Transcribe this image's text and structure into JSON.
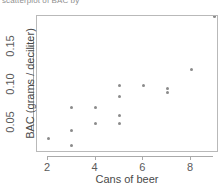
{
  "top_caption": "scatterplot of BAC by",
  "chart_data": {
    "type": "scatter",
    "title": "",
    "xlabel": "Cans of beer",
    "ylabel": "BAC (grams / deciliter)",
    "xlim": [
      0.45,
      9.45
    ],
    "ylim": [
      0.0,
      0.2
    ],
    "grid": false,
    "legend": "none",
    "marker": {
      "shape": "circle",
      "color": "#8b8b8b",
      "size_px": 3
    },
    "frame": true,
    "xticks": [
      2,
      4,
      6,
      8
    ],
    "xtick_labels": [
      "2",
      "4",
      "6",
      "8"
    ],
    "yticks": [
      0.05,
      0.1,
      0.15
    ],
    "ytick_labels": [
      "0.05",
      "0.10",
      "0.15"
    ],
    "x": [
      1,
      2,
      3,
      3,
      3,
      4,
      4,
      5,
      5,
      5,
      5,
      6,
      7,
      7,
      8,
      9
    ],
    "y": [
      0.01,
      0.03,
      0.02,
      0.04,
      0.07,
      0.05,
      0.07,
      0.05,
      0.06,
      0.085,
      0.1,
      0.1,
      0.09,
      0.095,
      0.12,
      0.19
    ],
    "points": [
      {
        "x": 1,
        "y": 0.01
      },
      {
        "x": 2,
        "y": 0.03
      },
      {
        "x": 3,
        "y": 0.02
      },
      {
        "x": 3,
        "y": 0.04
      },
      {
        "x": 3,
        "y": 0.07
      },
      {
        "x": 4,
        "y": 0.05
      },
      {
        "x": 4,
        "y": 0.07
      },
      {
        "x": 5,
        "y": 0.05
      },
      {
        "x": 5,
        "y": 0.06
      },
      {
        "x": 5,
        "y": 0.085
      },
      {
        "x": 5,
        "y": 0.1
      },
      {
        "x": 6,
        "y": 0.1
      },
      {
        "x": 7,
        "y": 0.09
      },
      {
        "x": 7,
        "y": 0.095
      },
      {
        "x": 8,
        "y": 0.12
      },
      {
        "x": 9,
        "y": 0.19
      }
    ]
  }
}
